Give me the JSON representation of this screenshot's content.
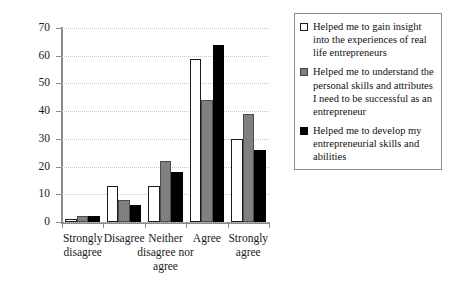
{
  "chart_data": {
    "type": "bar",
    "title": "",
    "subtitle": "",
    "xlabel": "",
    "ylabel": "",
    "ylim": [
      0,
      70
    ],
    "yticks": [
      0,
      10,
      20,
      30,
      40,
      50,
      60,
      70
    ],
    "ytick_labels": [
      "0",
      "10",
      "20",
      "30",
      "40",
      "50",
      "60",
      "70"
    ],
    "grid": true,
    "grid_axis": "y",
    "grid_style": "dotted",
    "legend_position": "top-right",
    "categories": [
      "Strongly\ndisagree",
      "Disagree",
      "Neither\ndisagree nor\nagree",
      "Agree",
      "Strongly\nagree"
    ],
    "category_labels_flat": [
      "Strongly disagree",
      "Disagree",
      "Neither disagree nor agree",
      "Agree",
      "Strongly agree"
    ],
    "series": [
      {
        "name": "Helped me to gain insight into the experiences of real life entrepreneurs",
        "color": "#ffffff",
        "edge_color": "#1a1a1a",
        "values": [
          1,
          13,
          13,
          59,
          30
        ]
      },
      {
        "name": "Helped me to understand the personal skills and attributes I need to be successful as an entrepreneur",
        "color": "#808080",
        "edge_color": "#4d4d4d",
        "values": [
          2,
          8,
          22,
          44,
          39
        ]
      },
      {
        "name": "Helped me to develop my entrepreneurial skills and abilities",
        "color": "#000000",
        "edge_color": "#000000",
        "values": [
          2,
          6,
          18,
          64,
          26
        ]
      }
    ]
  },
  "legend": {
    "items": [
      {
        "swatch": "white-square-swatch",
        "label": "Helped me to gain insight into the experiences of real life entrepreneurs"
      },
      {
        "swatch": "gray-square-swatch",
        "label": "Helped me to understand the personal skills and attributes I need to be successful as an entrepreneur"
      },
      {
        "swatch": "black-square-swatch",
        "label": "Helped me to develop my entrepreneurial skills and abilities"
      }
    ]
  },
  "axis": {
    "y_min": 0,
    "y_max": 70,
    "y_step": 10
  }
}
